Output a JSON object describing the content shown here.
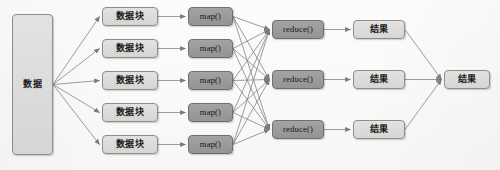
{
  "diagram": {
    "type": "flow-diagram",
    "background_color": "#fbfbfa",
    "node_fill_light": "#dcdcdb",
    "node_fill_dark": "#9a9a99",
    "node_border_color": "#8d8d8d",
    "edge_color": "#8a8a8a",
    "text_color": "#1c1c1c",
    "columns": [
      {
        "key": "source",
        "label": "数据",
        "count": 1
      },
      {
        "key": "chunks",
        "label": "数据块",
        "count": 5
      },
      {
        "key": "mappers",
        "label": "map()",
        "count": 5
      },
      {
        "key": "reducers",
        "label": "reduce()",
        "count": 3
      },
      {
        "key": "partials",
        "label": "结果",
        "count": 3
      },
      {
        "key": "final",
        "label": "结果",
        "count": 1
      }
    ],
    "source": {
      "label": "数据",
      "x": 12,
      "y": 14,
      "w": 41,
      "h": 141,
      "style": "light"
    },
    "chunks": [
      {
        "label": "数据块",
        "x": 102,
        "y": 7,
        "w": 56,
        "h": 19,
        "style": "light"
      },
      {
        "label": "数据块",
        "x": 102,
        "y": 39,
        "w": 56,
        "h": 19,
        "style": "light"
      },
      {
        "label": "数据块",
        "x": 102,
        "y": 71,
        "w": 56,
        "h": 19,
        "style": "light"
      },
      {
        "label": "数据块",
        "x": 102,
        "y": 103,
        "w": 56,
        "h": 19,
        "style": "light"
      },
      {
        "label": "数据块",
        "x": 102,
        "y": 135,
        "w": 56,
        "h": 19,
        "style": "light"
      }
    ],
    "mappers": [
      {
        "label": "map()",
        "x": 188,
        "y": 7,
        "w": 45,
        "h": 19,
        "style": "dark"
      },
      {
        "label": "map()",
        "x": 188,
        "y": 39,
        "w": 45,
        "h": 19,
        "style": "dark"
      },
      {
        "label": "map()",
        "x": 188,
        "y": 71,
        "w": 45,
        "h": 19,
        "style": "dark"
      },
      {
        "label": "map()",
        "x": 188,
        "y": 103,
        "w": 45,
        "h": 19,
        "style": "dark"
      },
      {
        "label": "map()",
        "x": 188,
        "y": 135,
        "w": 45,
        "h": 19,
        "style": "dark"
      }
    ],
    "reducers": [
      {
        "label": "reduce()",
        "x": 272,
        "y": 20,
        "w": 52,
        "h": 19,
        "style": "dark"
      },
      {
        "label": "reduce()",
        "x": 272,
        "y": 70,
        "w": 52,
        "h": 19,
        "style": "dark"
      },
      {
        "label": "reduce()",
        "x": 272,
        "y": 120,
        "w": 52,
        "h": 19,
        "style": "dark"
      }
    ],
    "partials": [
      {
        "label": "结果",
        "x": 353,
        "y": 20,
        "w": 52,
        "h": 19,
        "style": "light"
      },
      {
        "label": "结果",
        "x": 353,
        "y": 70,
        "w": 52,
        "h": 19,
        "style": "light"
      },
      {
        "label": "结果",
        "x": 353,
        "y": 120,
        "w": 52,
        "h": 19,
        "style": "light"
      }
    ],
    "final": {
      "label": "结果",
      "x": 444,
      "y": 70,
      "w": 46,
      "h": 19,
      "style": "light"
    },
    "edge_groups": [
      {
        "name": "source-to-chunks",
        "from": "source",
        "to": "chunks",
        "fanout": "one-to-many",
        "count": 5
      },
      {
        "name": "chunks-to-mappers",
        "from": "chunks",
        "to": "mappers",
        "fanout": "one-to-one",
        "count": 5
      },
      {
        "name": "mappers-to-reducers",
        "from": "mappers",
        "to": "reducers",
        "fanout": "all-to-all",
        "count": 15
      },
      {
        "name": "reducers-to-partials",
        "from": "reducers",
        "to": "partials",
        "fanout": "one-to-one",
        "count": 3
      },
      {
        "name": "partials-to-final",
        "from": "partials",
        "to": "final",
        "fanout": "many-to-one",
        "count": 3
      }
    ]
  }
}
